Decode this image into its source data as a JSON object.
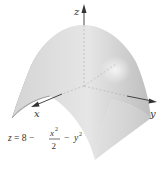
{
  "figure": {
    "type": "3d-surface-plot",
    "surface": "elliptic paraboloid (downward-opening)",
    "equation": {
      "lhs": "z = 8 −",
      "frac_num": "x",
      "frac_num_exp": "2",
      "frac_den": "2",
      "minus": "−",
      "term": "y",
      "term_exp": "2",
      "full": "z = 8 − x²/2 − y²"
    },
    "axes": {
      "z": "z",
      "x": "x",
      "y": "y"
    },
    "colors": {
      "surface_light": "#e8e8e8",
      "surface_dark": "#8a8a8a",
      "axis": "#333333",
      "hidden_axis": "#b5b5b5"
    }
  }
}
